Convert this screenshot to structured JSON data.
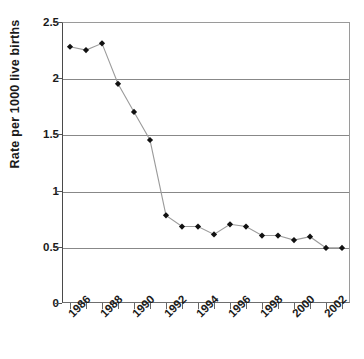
{
  "chart_data": {
    "type": "line",
    "title": "",
    "xlabel": "",
    "ylabel": "Rate per 1000 live births",
    "categories": [
      1986,
      1987,
      1988,
      1989,
      1990,
      1991,
      1992,
      1993,
      1994,
      1995,
      1996,
      1997,
      1998,
      1999,
      2000,
      2001,
      2002,
      2003
    ],
    "values": [
      2.28,
      2.25,
      2.31,
      1.95,
      1.7,
      1.45,
      0.78,
      0.68,
      0.68,
      0.61,
      0.7,
      0.68,
      0.6,
      0.6,
      0.56,
      0.59,
      0.49,
      0.49
    ],
    "series": [
      {
        "name": "Rate per 1000 live births",
        "values": [
          2.28,
          2.25,
          2.31,
          1.95,
          1.7,
          1.45,
          0.78,
          0.68,
          0.68,
          0.61,
          0.7,
          0.68,
          0.6,
          0.6,
          0.56,
          0.59,
          0.49,
          0.49
        ]
      }
    ],
    "xlim": [
      1986,
      2003
    ],
    "ylim": [
      0,
      2.5
    ],
    "ytick_labels": [
      "0",
      "0.5",
      "1",
      "1.5",
      "2",
      "2.5"
    ],
    "ytick_values": [
      0,
      0.5,
      1,
      1.5,
      2,
      2.5
    ],
    "xtick_labels": [
      "1986",
      "1988",
      "1990",
      "1992",
      "1994",
      "1996",
      "1998",
      "2000",
      "2002"
    ],
    "xtick_values": [
      1986,
      1988,
      1990,
      1992,
      1994,
      1996,
      1998,
      2000,
      2002
    ],
    "grid": "horizontal",
    "legend": "none",
    "marker": "diamond",
    "marker_color": "#111111",
    "line_color": "#9b9b9b"
  }
}
